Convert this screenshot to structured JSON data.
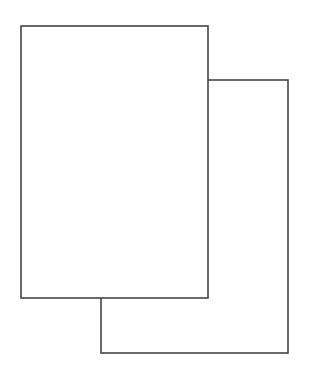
{
  "diagram": {
    "canvas": {
      "width": 316,
      "height": 387,
      "background": "#ffffff"
    },
    "stroke_color": "#454545",
    "stroke_width": 1.6,
    "shapes": [
      {
        "id": "back-page",
        "type": "rect",
        "x": 101,
        "y": 80,
        "width": 187,
        "height": 273,
        "fill": "#ffffff"
      },
      {
        "id": "front-page",
        "type": "rect",
        "x": 21,
        "y": 26,
        "width": 187,
        "height": 272,
        "fill": "#ffffff"
      }
    ]
  }
}
